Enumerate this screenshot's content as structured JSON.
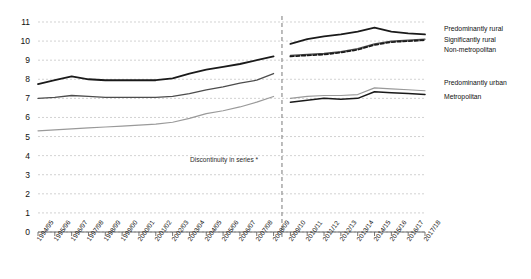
{
  "chart_data": {
    "type": "line",
    "title": "",
    "xlabel": "",
    "ylabel": "",
    "ylim": [
      0,
      11
    ],
    "ytick_step": 1,
    "grid": true,
    "legend_position": "right",
    "annotation": "Discontinuity in series *",
    "discontinuity_between": [
      "2008/09",
      "2009/10"
    ],
    "categories": [
      "1994/95",
      "1995/96",
      "1996/97",
      "1997/98",
      "1998/99",
      "1999/00",
      "2000/01",
      "2001/02",
      "2002/03",
      "2003/04",
      "2004/05",
      "2005/06",
      "2006/07",
      "2007/08",
      "2008/09",
      "2009/10",
      "2010/11",
      "2011/12",
      "2012/13",
      "2013/14",
      "2014/15",
      "2015/16",
      "2016/17",
      "2017/18"
    ],
    "yticks": [
      "0",
      "1",
      "2",
      "3",
      "4",
      "5",
      "6",
      "7",
      "8",
      "9",
      "10",
      "11"
    ],
    "series": [
      {
        "name": "Predominantly rural",
        "style": "solid",
        "color": "#1a1a1a",
        "width": 1.8,
        "segments": [
          {
            "x": [
              "1994/95",
              "1995/96",
              "1996/97",
              "1997/98",
              "1998/99",
              "1999/00",
              "2000/01",
              "2001/02",
              "2002/03",
              "2003/04",
              "2004/05",
              "2005/06",
              "2006/07",
              "2007/08",
              "2008/09"
            ],
            "values": [
              7.75,
              7.95,
              8.15,
              8.0,
              7.95,
              7.95,
              7.95,
              7.95,
              8.05,
              8.3,
              8.5,
              8.65,
              8.8,
              9.0,
              9.2
            ]
          },
          {
            "x": [
              "2009/10",
              "2010/11",
              "2011/12",
              "2012/13",
              "2013/14",
              "2014/15",
              "2015/16",
              "2016/17",
              "2017/18"
            ],
            "values": [
              9.85,
              10.1,
              10.25,
              10.35,
              10.5,
              10.7,
              10.5,
              10.4,
              10.35
            ]
          }
        ]
      },
      {
        "name": "Significantly rural",
        "style": "solid",
        "color": "#4d4d4d",
        "width": 1.3,
        "segments": [
          {
            "x": [
              "1994/95",
              "1995/96",
              "1996/97",
              "1997/98",
              "1998/99",
              "1999/00",
              "2000/01",
              "2001/02",
              "2002/03",
              "2003/04",
              "2004/05",
              "2005/06",
              "2006/07",
              "2007/08",
              "2008/09"
            ],
            "values": [
              7.0,
              7.05,
              7.15,
              7.1,
              7.05,
              7.05,
              7.05,
              7.05,
              7.1,
              7.25,
              7.45,
              7.6,
              7.8,
              7.95,
              8.3
            ]
          },
          {
            "x": [
              "2009/10",
              "2010/11",
              "2011/12",
              "2012/13",
              "2013/14",
              "2014/15",
              "2015/16",
              "2016/17",
              "2017/18"
            ],
            "values": [
              9.25,
              9.3,
              9.35,
              9.45,
              9.6,
              9.85,
              10.0,
              10.05,
              10.1
            ]
          }
        ]
      },
      {
        "name": "Non-metropolitan",
        "style": "dashed",
        "color": "#1a1a1a",
        "width": 1.8,
        "segments": [
          {
            "x": [
              "2009/10",
              "2010/11",
              "2011/12",
              "2012/13",
              "2013/14",
              "2014/15",
              "2015/16",
              "2016/17",
              "2017/18"
            ],
            "values": [
              9.2,
              9.25,
              9.3,
              9.4,
              9.55,
              9.8,
              9.95,
              10.0,
              10.05
            ]
          }
        ]
      },
      {
        "name": "Predominantly urban",
        "style": "solid",
        "color": "#9a9a9a",
        "width": 1.2,
        "segments": [
          {
            "x": [
              "1994/95",
              "1995/96",
              "1996/97",
              "1997/98",
              "1998/99",
              "1999/00",
              "2000/01",
              "2001/02",
              "2002/03",
              "2003/04",
              "2004/05",
              "2005/06",
              "2006/07",
              "2007/08",
              "2008/09"
            ],
            "values": [
              5.3,
              5.35,
              5.4,
              5.45,
              5.5,
              5.55,
              5.6,
              5.65,
              5.75,
              5.95,
              6.2,
              6.35,
              6.55,
              6.8,
              7.1
            ]
          },
          {
            "x": [
              "2009/10",
              "2010/11",
              "2011/12",
              "2012/13",
              "2013/14",
              "2014/15",
              "2015/16",
              "2016/17",
              "2017/18"
            ],
            "values": [
              7.0,
              7.1,
              7.15,
              7.15,
              7.2,
              7.55,
              7.5,
              7.45,
              7.4
            ]
          }
        ]
      },
      {
        "name": "Metropolitan",
        "style": "solid",
        "color": "#1a1a1a",
        "width": 1.5,
        "segments": [
          {
            "x": [
              "2009/10",
              "2010/11",
              "2011/12",
              "2012/13",
              "2013/14",
              "2014/15",
              "2015/16",
              "2016/17",
              "2017/18"
            ],
            "values": [
              6.8,
              6.9,
              7.0,
              6.95,
              7.0,
              7.35,
              7.3,
              7.25,
              7.2
            ]
          }
        ]
      }
    ]
  },
  "legend": {
    "entries": [
      {
        "label": "Predominantly rural"
      },
      {
        "label": "Significantly rural"
      },
      {
        "label": "Non-metropolitan"
      },
      {
        "label": "Predominantly urban"
      },
      {
        "label": "Metropolitan"
      }
    ]
  }
}
